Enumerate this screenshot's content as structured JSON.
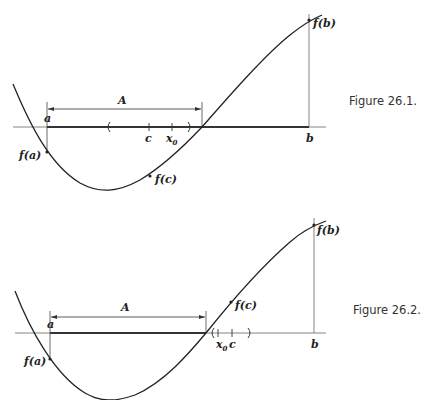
{
  "figures": [
    {
      "id": "fig1",
      "caption": "Figure 26.1.",
      "labels": {
        "a": "a",
        "b": "b",
        "c": "c",
        "x0": "x",
        "x0_sub": "0",
        "interval": "A",
        "fa": "f(a)",
        "fb": "f(b)",
        "fc": "f(c)"
      },
      "description": "Continuous f on [a,b] with f(a)<0<f(b); A = set where f<0 starting at a; c = sup A; neighborhood around x0 with f(c) < 0 shown"
    },
    {
      "id": "fig2",
      "caption": "Figure 26.2.",
      "labels": {
        "a": "a",
        "b": "b",
        "c": "c",
        "x0": "x",
        "x0_sub": "0",
        "interval": "A",
        "fa": "f(a)",
        "fb": "f(b)",
        "fc": "f(c)"
      },
      "description": "Case where f(c) > 0; neighborhood around x0 to the right of the zero"
    }
  ],
  "colors": {
    "ink": "#222222",
    "axis": "#555555",
    "thick_segment": "#333333"
  }
}
